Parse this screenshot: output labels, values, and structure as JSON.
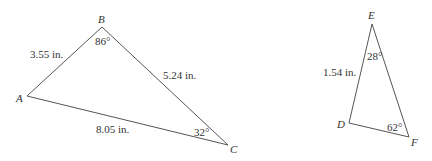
{
  "triangles": [
    {
      "name": "ABC",
      "vertices": {
        "A": {
          "label": "A",
          "x": 27,
          "y": 96
        },
        "B": {
          "label": "B",
          "x": 102,
          "y": 27
        },
        "C": {
          "label": "C",
          "x": 228,
          "y": 145
        }
      },
      "sides": {
        "AB": "3.55 in.",
        "BC": "5.24 in.",
        "AC": "8.05 in."
      },
      "angles": {
        "B": "86°",
        "C": "32°"
      }
    },
    {
      "name": "DEF",
      "vertices": {
        "D": {
          "label": "D",
          "x": 349,
          "y": 123
        },
        "E": {
          "label": "E",
          "x": 372,
          "y": 24
        },
        "F": {
          "label": "F",
          "x": 409,
          "y": 137
        }
      },
      "sides": {
        "DE": "1.54 in."
      },
      "angles": {
        "E": "28°",
        "F": "62°"
      }
    }
  ]
}
